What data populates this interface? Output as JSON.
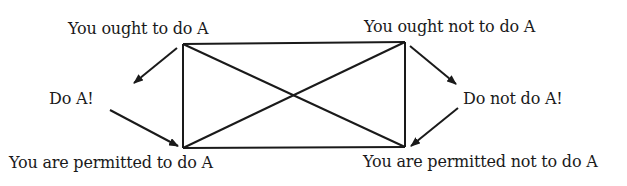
{
  "diagram": {
    "type": "deontic-square-of-opposition",
    "nodes": {
      "top_left": "You ought to do A",
      "top_right": "You ought not to do A",
      "bottom_left": "You are permitted to do A",
      "bottom_right": "You are permitted not to do A",
      "middle_left": "Do A!",
      "middle_right": "Do not do A!"
    },
    "edges": [
      {
        "from": "top_left",
        "to": "top_right",
        "style": "line"
      },
      {
        "from": "bottom_left",
        "to": "bottom_right",
        "style": "line"
      },
      {
        "from": "top_left",
        "to": "bottom_left",
        "style": "line"
      },
      {
        "from": "top_right",
        "to": "bottom_right",
        "style": "line"
      },
      {
        "from": "top_left",
        "to": "bottom_right",
        "style": "diagonal"
      },
      {
        "from": "top_right",
        "to": "bottom_left",
        "style": "diagonal"
      },
      {
        "from": "top_left",
        "to": "middle_left",
        "style": "arrow"
      },
      {
        "from": "middle_left",
        "to": "bottom_left",
        "style": "arrow"
      },
      {
        "from": "top_right",
        "to": "middle_right",
        "style": "arrow"
      },
      {
        "from": "middle_right",
        "to": "bottom_right",
        "style": "arrow"
      }
    ],
    "line_color": "#1a1a1a"
  }
}
